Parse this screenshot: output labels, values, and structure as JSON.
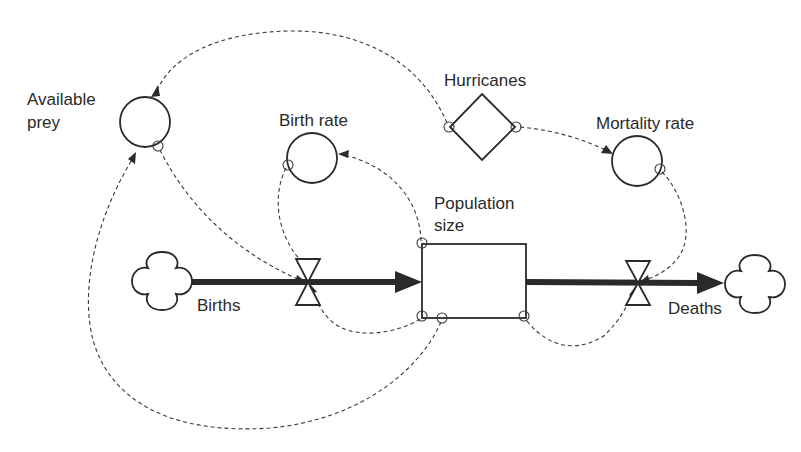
{
  "diagram": {
    "type": "stock-and-flow",
    "nodes": {
      "available_prey": {
        "label_line1": "Available",
        "label_line2": "prey",
        "kind": "converter"
      },
      "birth_rate": {
        "label": "Birth rate",
        "kind": "converter"
      },
      "hurricanes": {
        "label": "Hurricanes",
        "kind": "external-input"
      },
      "mortality_rate": {
        "label": "Mortality rate",
        "kind": "converter"
      },
      "population_size": {
        "label_line1": "Population",
        "label_line2": "size",
        "kind": "stock"
      },
      "births": {
        "label": "Births",
        "kind": "inflow"
      },
      "deaths": {
        "label": "Deaths",
        "kind": "outflow"
      },
      "source_cloud": {
        "kind": "source"
      },
      "sink_cloud": {
        "kind": "sink"
      }
    },
    "links": [
      {
        "from": "Hurricanes",
        "to": "Available prey"
      },
      {
        "from": "Hurricanes",
        "to": "Mortality rate"
      },
      {
        "from": "Available prey",
        "to": "Births"
      },
      {
        "from": "Birth rate",
        "to": "Births"
      },
      {
        "from": "Population size",
        "to": "Birth rate"
      },
      {
        "from": "Population size",
        "to": "Births"
      },
      {
        "from": "Population size",
        "to": "Available prey"
      },
      {
        "from": "Population size",
        "to": "Deaths"
      },
      {
        "from": "Mortality rate",
        "to": "Deaths"
      }
    ],
    "flows": [
      {
        "from": "source cloud",
        "to": "Population size",
        "via": "Births"
      },
      {
        "from": "Population size",
        "to": "sink cloud",
        "via": "Deaths"
      }
    ]
  }
}
